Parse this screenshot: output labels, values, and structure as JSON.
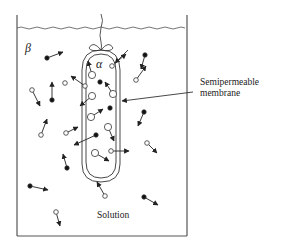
{
  "figure": {
    "type": "osmosis-diagram",
    "labels": {
      "outer_region": "β",
      "inner_region": "α",
      "membrane_line1": "Semipermeable",
      "membrane_line2": "membrane",
      "solution": "Solution"
    },
    "legend": {
      "filled_dot": "solute particle",
      "open_circle": "solvent particle"
    },
    "colors": {
      "stroke": "#222222",
      "background": "#ffffff"
    }
  },
  "particles": [
    {
      "kind": "filled",
      "x": 47,
      "y": 58,
      "dx": 16,
      "dy": -6
    },
    {
      "kind": "open-small",
      "x": 32,
      "y": 90,
      "dx": 8,
      "dy": 16
    },
    {
      "kind": "filled",
      "x": 52,
      "y": 100,
      "dx": 0,
      "dy": -18
    },
    {
      "kind": "open-small",
      "x": 65,
      "y": 83,
      "dx": 0,
      "dy": 0
    },
    {
      "kind": "open-small",
      "x": 41,
      "y": 135,
      "dx": 6,
      "dy": -16
    },
    {
      "kind": "open-small",
      "x": 66,
      "y": 133,
      "dx": 12,
      "dy": -6
    },
    {
      "kind": "filled",
      "x": 67,
      "y": 168,
      "dx": -4,
      "dy": -14
    },
    {
      "kind": "filled",
      "x": 30,
      "y": 186,
      "dx": 18,
      "dy": 4
    },
    {
      "kind": "open-small",
      "x": 56,
      "y": 212,
      "dx": 4,
      "dy": 14
    },
    {
      "kind": "open-small",
      "x": 105,
      "y": 196,
      "dx": -8,
      "dy": -14
    },
    {
      "kind": "filled",
      "x": 144,
      "y": 197,
      "dx": 14,
      "dy": 8
    },
    {
      "kind": "open-small",
      "x": 147,
      "y": 143,
      "dx": 10,
      "dy": 10
    },
    {
      "kind": "open-small",
      "x": 136,
      "y": 80,
      "dx": 10,
      "dy": -14
    },
    {
      "kind": "filled",
      "x": 145,
      "y": 55,
      "dx": -4,
      "dy": 14
    },
    {
      "kind": "filled",
      "x": 144,
      "y": 112,
      "dx": -6,
      "dy": 14
    },
    {
      "kind": "open-small",
      "x": 112,
      "y": 66,
      "dx": 14,
      "dy": -12
    },
    {
      "kind": "open-large",
      "x": 92,
      "y": 75,
      "dx": -4,
      "dy": -14
    },
    {
      "kind": "filled",
      "x": 100,
      "y": 82,
      "dx": 0,
      "dy": 0
    },
    {
      "kind": "open-large",
      "x": 113,
      "y": 94,
      "dx": -8,
      "dy": -12
    },
    {
      "kind": "open-large",
      "x": 92,
      "y": 96,
      "dx": -12,
      "dy": 10
    },
    {
      "kind": "open-small",
      "x": 85,
      "y": 86,
      "dx": -14,
      "dy": -10
    },
    {
      "kind": "filled",
      "x": 110,
      "y": 108,
      "dx": 0,
      "dy": 0
    },
    {
      "kind": "open-large",
      "x": 91,
      "y": 117,
      "dx": 12,
      "dy": -8
    },
    {
      "kind": "open-large",
      "x": 108,
      "y": 127,
      "dx": 6,
      "dy": 14
    },
    {
      "kind": "filled",
      "x": 96,
      "y": 135,
      "dx": -22,
      "dy": 10
    },
    {
      "kind": "open-large",
      "x": 95,
      "y": 153,
      "dx": 14,
      "dy": 8
    },
    {
      "kind": "open-small",
      "x": 111,
      "y": 151,
      "dx": 18,
      "dy": 0
    }
  ]
}
